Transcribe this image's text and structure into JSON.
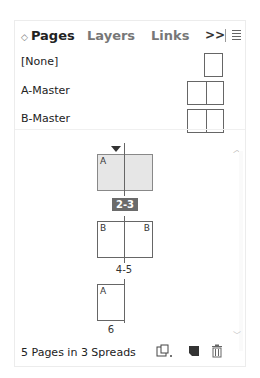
{
  "tabs": [
    {
      "label": "Pages",
      "active": true
    },
    {
      "label": "Layers",
      "active": false
    },
    {
      "label": "Links",
      "active": false
    }
  ],
  "header": {
    "overflow_label": ">>",
    "updown_glyph": "↕"
  },
  "masters": [
    {
      "label": "[None]",
      "type": "single"
    },
    {
      "label": "A-Master",
      "type": "spread"
    },
    {
      "label": "B-Master",
      "type": "spread"
    }
  ],
  "spreads": [
    {
      "label": "2-3",
      "left_prefix": "A",
      "right_prefix": "",
      "selected": true
    },
    {
      "label": "4-5",
      "left_prefix": "B",
      "right_prefix": "B",
      "selected": false
    },
    {
      "label": "6",
      "left_prefix": "A",
      "selected": false
    }
  ],
  "footer": {
    "status": "5 Pages in 3 Spreads",
    "icons": [
      "edit-page-size-icon",
      "new-page-icon",
      "delete-page-icon"
    ]
  }
}
